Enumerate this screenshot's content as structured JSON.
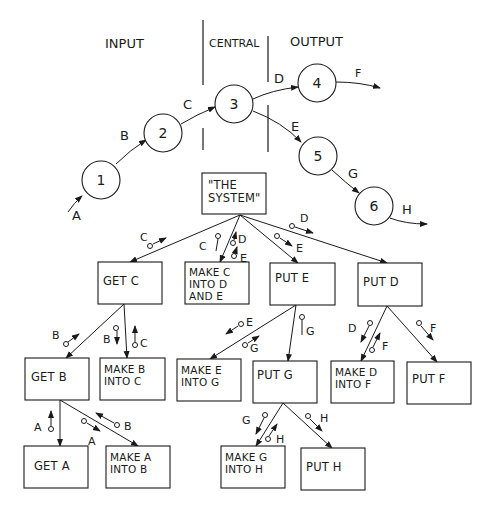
{
  "sections": {
    "input": "INPUT",
    "central": "CENTRAL",
    "output": "OUTPUT"
  },
  "flow_nodes": [
    {
      "id": "1",
      "label": "1",
      "cx": 101,
      "cy": 180
    },
    {
      "id": "2",
      "label": "2",
      "cx": 163,
      "cy": 133
    },
    {
      "id": "3",
      "label": "3",
      "cx": 234,
      "cy": 104
    },
    {
      "id": "4",
      "label": "4",
      "cx": 317,
      "cy": 83
    },
    {
      "id": "5",
      "label": "5",
      "cx": 318,
      "cy": 156
    },
    {
      "id": "6",
      "label": "6",
      "cx": 374,
      "cy": 206
    }
  ],
  "flow_edges": [
    {
      "from": "start",
      "to": "1",
      "label": "A"
    },
    {
      "from": "1",
      "to": "2",
      "label": "B"
    },
    {
      "from": "2",
      "to": "3",
      "label": "C"
    },
    {
      "from": "3",
      "to": "4",
      "label": "D"
    },
    {
      "from": "3",
      "to": "5",
      "label": "E"
    },
    {
      "from": "4",
      "to": "end",
      "label": "F"
    },
    {
      "from": "5",
      "to": "6",
      "label": "G"
    },
    {
      "from": "6",
      "to": "end",
      "label": "H"
    }
  ],
  "tree": {
    "root": {
      "text": "\"THE SYSTEM\""
    },
    "level1": [
      {
        "text": "GET C"
      },
      {
        "text": "MAKE C INTO D AND E"
      },
      {
        "text": "PUT E"
      },
      {
        "text": "PUT D"
      }
    ],
    "level2": [
      {
        "text": "GET B"
      },
      {
        "text": "MAKE B INTO C"
      },
      {
        "text": "MAKE E INTO G"
      },
      {
        "text": "PUT G"
      },
      {
        "text": "MAKE D INTO F"
      },
      {
        "text": "PUT F"
      }
    ],
    "level3": [
      {
        "text": "GET A"
      },
      {
        "text": "MAKE A INTO B"
      },
      {
        "text": "MAKE G INTO H"
      },
      {
        "text": "PUT H"
      }
    ]
  },
  "couples": {
    "sys_getc": "C",
    "sys_make_c": "C",
    "sys_make_d": "D",
    "sys_make_e": "E",
    "sys_pute": "E",
    "sys_putd": "D",
    "getc_getb": "B",
    "getc_make_b": "B",
    "getc_make_c": "C",
    "pute_make_e": "E",
    "pute_make_g": "G",
    "pute_putg": "G",
    "putd_make_d": "D",
    "putd_make_f": "F",
    "putd_putf": "F",
    "getb_geta": "A",
    "getb_make_a": "A",
    "getb_make_b": "B",
    "putg_make_g": "G",
    "putg_make_h": "H",
    "putg_puth": "H"
  }
}
